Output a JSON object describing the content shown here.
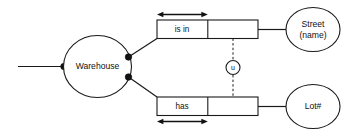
{
  "diagram": {
    "type": "orm-fact-diagram",
    "background_color": "#ffffff",
    "stroke_color": "#1a1a1a",
    "entities": [
      {
        "id": "warehouse",
        "label": "Warehouse",
        "shape": "ellipse"
      },
      {
        "id": "street",
        "label_line1": "Street",
        "label_line2": "(name)",
        "shape": "ellipse"
      },
      {
        "id": "lot",
        "label": "Lot#",
        "shape": "ellipse"
      }
    ],
    "predicates": [
      {
        "id": "is-in",
        "label": "is in",
        "cells": 2,
        "arrow_position": "above",
        "arrow_span": "first-cell"
      },
      {
        "id": "has",
        "label": "has",
        "cells": 2,
        "arrow_position": "below",
        "arrow_span": "first-cell"
      }
    ],
    "constraints": [
      {
        "id": "uniqueness-constraint",
        "label": "u",
        "shape": "circle",
        "connector": "dashed-vertical"
      }
    ]
  }
}
